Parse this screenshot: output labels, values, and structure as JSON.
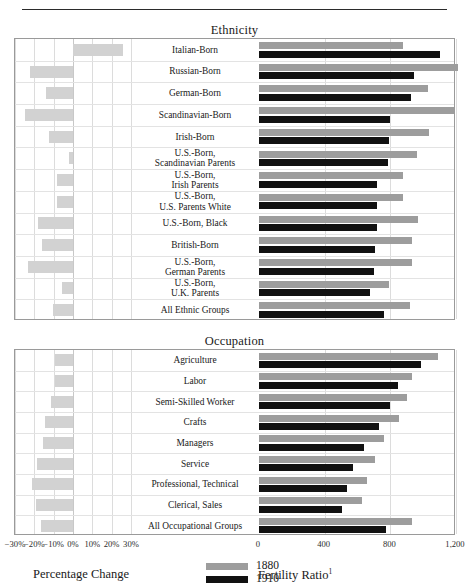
{
  "figure": {
    "legend": [
      {
        "key": "1880",
        "color": "#9d9d9d"
      },
      {
        "key": "1910",
        "color": "#111111"
      }
    ],
    "caption_left": "Percentage Change",
    "caption_right": "Fertility Ratio",
    "caption_right_note": "1"
  },
  "chart_data": {
    "type": "bar",
    "orientation": "horizontal",
    "grid": true,
    "legend_position": "bottom-center",
    "panels": [
      {
        "title": "Ethnicity",
        "categories": [
          "Italian-Born",
          "Russian-Born",
          "German-Born",
          "Scandinavian-Born",
          "Irish-Born",
          "U.S.-Born,\nScandinavian Parents",
          "U.S.-Born,\nIrish Parents",
          "U.S.-Born,\nU.S. Parents White",
          "U.S.-Born, Black",
          "British-Born",
          "U.S.-Born,\nGerman Parents",
          "U.S.-Born,\nU.K. Parents",
          "All Ethnic Groups"
        ],
        "left_chart": {
          "xlabel": "Percentage Change",
          "xlim": [
            -30,
            30
          ],
          "xticks": [
            -30,
            -20,
            -10,
            0,
            10,
            20,
            30
          ],
          "xticklabels": [
            "−30%",
            "−20%",
            "−10%",
            "0%",
            "10%",
            "20%",
            "30%"
          ],
          "values": [
            26.0,
            -22.0,
            -14.0,
            -25.0,
            -12.5,
            -2.0,
            -8.5,
            -8.5,
            -18.0,
            -16.0,
            -23.5,
            -5.5,
            -10.5
          ]
        },
        "right_chart": {
          "xlabel": "Fertility Ratio",
          "xlim": [
            0,
            1200
          ],
          "xticks": [
            0,
            400,
            800,
            1200
          ],
          "xticklabels": [
            "0",
            "400",
            "800",
            "1,200"
          ],
          "series": [
            {
              "name": "1880",
              "values": [
                875,
                1210,
                1030,
                1190,
                1035,
                960,
                880,
                880,
                970,
                930,
                930,
                790,
                920
              ]
            },
            {
              "name": "1910",
              "values": [
                1100,
                945,
                925,
                795,
                790,
                785,
                720,
                720,
                720,
                705,
                700,
                675,
                760
              ]
            }
          ]
        }
      },
      {
        "title": "Occupation",
        "categories": [
          "Agriculture",
          "Labor",
          "Semi-Skilled Worker",
          "Crafts",
          "Managers",
          "Service",
          "Professional, Technical",
          "Clerical, Sales",
          "All Occupational Groups"
        ],
        "left_chart": {
          "xlabel": "Percentage Change",
          "xlim": [
            -30,
            30
          ],
          "xticks": [
            -30,
            -20,
            -10,
            0,
            10,
            20,
            30
          ],
          "xticklabels": [
            "−30%",
            "−20%",
            "−10%",
            "0%",
            "10%",
            "20%",
            "30%"
          ],
          "values": [
            -9.5,
            -9.5,
            -11.5,
            -14.5,
            -15.5,
            -18.5,
            -21.0,
            -19.0,
            -16.5
          ]
        },
        "right_chart": {
          "xlabel": "Fertility Ratio",
          "xlim": [
            0,
            1200
          ],
          "xticks": [
            0,
            400,
            800,
            1200
          ],
          "xticklabels": [
            "0",
            "400",
            "800",
            "1,200"
          ],
          "series": [
            {
              "name": "1880",
              "values": [
                1090,
                935,
                900,
                855,
                760,
                705,
                655,
                625,
                930
              ]
            },
            {
              "name": "1910",
              "values": [
                985,
                845,
                800,
                730,
                640,
                570,
                535,
                505,
                775
              ]
            }
          ]
        }
      }
    ]
  }
}
